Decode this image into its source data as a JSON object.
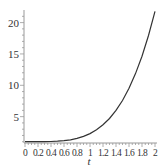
{
  "chart_data": {
    "type": "line",
    "title": "",
    "xlabel": "t",
    "ylabel": "",
    "xlim": [
      0,
      2
    ],
    "ylim": [
      0.8,
      22
    ],
    "grid": false,
    "legend": null,
    "x_ticks": [
      0,
      0.2,
      0.4,
      0.6,
      0.8,
      1,
      1.2,
      1.4,
      1.6,
      1.8,
      2
    ],
    "x_tick_labels": [
      "0",
      "0.2",
      "0.4",
      "0.6",
      "0.8",
      "1",
      "1.2",
      "1.4",
      "1.6",
      "1.8",
      "2"
    ],
    "y_ticks": [
      5,
      10,
      15,
      20
    ],
    "y_tick_labels": [
      "5",
      "10",
      "15",
      "20"
    ],
    "series": [
      {
        "name": "f(t)",
        "color": "#333333",
        "x": [
          0,
          0.1,
          0.2,
          0.3,
          0.4,
          0.5,
          0.6,
          0.7,
          0.8,
          0.9,
          1.0,
          1.1,
          1.2,
          1.3,
          1.4,
          1.5,
          1.6,
          1.7,
          1.8,
          1.9,
          2.0
        ],
        "y": [
          1.0,
          1.0,
          1.0,
          1.01,
          1.03,
          1.08,
          1.17,
          1.31,
          1.53,
          1.85,
          2.3,
          2.9,
          3.7,
          4.71,
          6.0,
          7.58,
          9.52,
          11.86,
          14.64,
          17.94,
          21.8
        ]
      }
    ]
  }
}
